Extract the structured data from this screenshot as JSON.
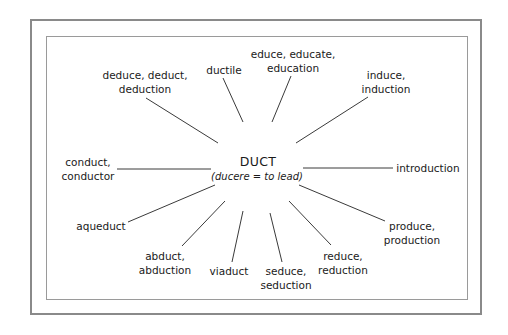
{
  "diagram": {
    "type": "word-root radial diagram",
    "center": {
      "root": "DUCT",
      "meaning": "(ducere = to lead)"
    },
    "branches": [
      {
        "id": "deduce",
        "lines": [
          "deduce, deduct,",
          "deduction"
        ]
      },
      {
        "id": "ductile",
        "lines": [
          "ductile"
        ]
      },
      {
        "id": "educe",
        "lines": [
          "educe, educate,",
          "education"
        ]
      },
      {
        "id": "induce",
        "lines": [
          "induce,",
          "induction"
        ]
      },
      {
        "id": "conduct",
        "lines": [
          "conduct,",
          "conductor"
        ]
      },
      {
        "id": "introduction",
        "lines": [
          "introduction"
        ]
      },
      {
        "id": "aqueduct",
        "lines": [
          "aqueduct"
        ]
      },
      {
        "id": "abduct",
        "lines": [
          "abduct,",
          "abduction"
        ]
      },
      {
        "id": "viaduct",
        "lines": [
          "viaduct"
        ]
      },
      {
        "id": "seduce",
        "lines": [
          "seduce,",
          "seduction"
        ]
      },
      {
        "id": "reduce",
        "lines": [
          "reduce,",
          "reduction"
        ]
      },
      {
        "id": "produce",
        "lines": [
          "produce,",
          "production"
        ]
      }
    ],
    "colors": {
      "text": "#1a1a1a",
      "lines": "#3a3a3a",
      "frame": "#8a8a8a",
      "background": "#ffffff"
    }
  }
}
